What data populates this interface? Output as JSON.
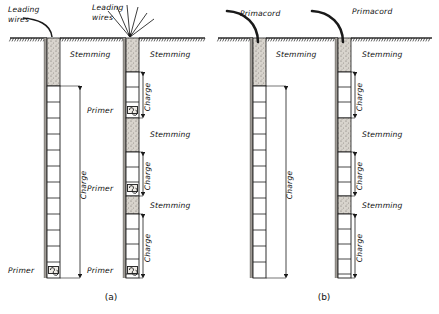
{
  "figure": {
    "type": "engineering-diagram",
    "panels": [
      {
        "id": "a",
        "caption": "(a)",
        "initiation": "Leading wires",
        "caption_x": 111,
        "caption_y": 300
      },
      {
        "id": "b",
        "caption": "(b)",
        "initiation": "Primacord",
        "caption_x": 324,
        "caption_y": 300
      }
    ]
  },
  "labels": {
    "leading_wires_line1": "Leading",
    "leading_wires_line2": "wires",
    "primacord": "Primacord",
    "stemming": "Stemming",
    "charge": "Charge",
    "primer": "Primer"
  },
  "colors": {
    "ink": "#1a1a1a",
    "ground": "#2b2b2b",
    "stemming_fill": "#cfcbc4",
    "rock_fill": "#8f8d89",
    "charge_fill": "#ffffff",
    "paper": "#ffffff"
  },
  "geometry": {
    "ground_y": 38,
    "hole_bottom_default": 278,
    "hole_width": 13
  },
  "holes": [
    {
      "name": "hole-a1",
      "panel": "a",
      "initiation": "leading-wires",
      "x": 47,
      "top": 38,
      "bottom": 278,
      "wire_label_x": 8,
      "wire_label_y": 12,
      "decks": [
        {
          "kind": "stemming",
          "from": 38,
          "to": 86,
          "label": "Stemming",
          "label_x": 70,
          "label_y": 57,
          "dim": false
        },
        {
          "kind": "charge",
          "from": 86,
          "to": 278,
          "label": "Charge",
          "label_x": 86,
          "label_y": 185,
          "dim": true,
          "dim_x": 80
        }
      ],
      "primers": [
        {
          "y": 270,
          "label": "Primer",
          "label_x": 8,
          "label_y": 273
        }
      ],
      "cartridge_step": 16
    },
    {
      "name": "hole-a2",
      "panel": "a",
      "initiation": "leading-wires-multi",
      "x": 126,
      "top": 38,
      "bottom": 278,
      "wire_label_x": 92,
      "wire_label_y": 10,
      "decks": [
        {
          "kind": "stemming",
          "from": 38,
          "to": 72,
          "label": "Stemming",
          "label_x": 150,
          "label_y": 57,
          "dim": false
        },
        {
          "kind": "charge",
          "from": 72,
          "to": 118,
          "label": "Charge",
          "label_x": 150,
          "label_y": 97,
          "dim": true,
          "dim_x": 143
        },
        {
          "kind": "stemming",
          "from": 118,
          "to": 152,
          "label": "Stemming",
          "label_x": 150,
          "label_y": 137,
          "dim": false
        },
        {
          "kind": "charge",
          "from": 152,
          "to": 196,
          "label": "Charge",
          "label_x": 150,
          "label_y": 176,
          "dim": true,
          "dim_x": 143
        },
        {
          "kind": "stemming",
          "from": 196,
          "to": 214,
          "label": "Stemming",
          "label_x": 150,
          "label_y": 208,
          "dim": false
        },
        {
          "kind": "charge",
          "from": 214,
          "to": 278,
          "label": "Charge",
          "label_x": 150,
          "label_y": 248,
          "dim": true,
          "dim_x": 143
        }
      ],
      "primers": [
        {
          "y": 110,
          "label": "Primer",
          "label_x": 87,
          "label_y": 113
        },
        {
          "y": 188,
          "label": "Primer",
          "label_x": 87,
          "label_y": 191
        },
        {
          "y": 270,
          "label": "Primer",
          "label_x": 87,
          "label_y": 273
        }
      ],
      "cartridge_step": 15
    },
    {
      "name": "hole-b1",
      "panel": "b",
      "initiation": "primacord",
      "x": 253,
      "top": 38,
      "bottom": 278,
      "cord_label_x": 240,
      "cord_label_y": 16,
      "decks": [
        {
          "kind": "stemming",
          "from": 38,
          "to": 86,
          "label": "Stemming",
          "label_x": 276,
          "label_y": 57,
          "dim": false
        },
        {
          "kind": "charge",
          "from": 86,
          "to": 278,
          "label": "Charge",
          "label_x": 292,
          "label_y": 185,
          "dim": true,
          "dim_x": 286
        }
      ],
      "primers": [],
      "cartridge_step": 16
    },
    {
      "name": "hole-b2",
      "panel": "b",
      "initiation": "primacord",
      "x": 338,
      "top": 38,
      "bottom": 278,
      "cord_label_x": 352,
      "cord_label_y": 14,
      "decks": [
        {
          "kind": "stemming",
          "from": 38,
          "to": 72,
          "label": "Stemming",
          "label_x": 362,
          "label_y": 57,
          "dim": false
        },
        {
          "kind": "charge",
          "from": 72,
          "to": 118,
          "label": "Charge",
          "label_x": 362,
          "label_y": 97,
          "dim": true,
          "dim_x": 355
        },
        {
          "kind": "stemming",
          "from": 118,
          "to": 152,
          "label": "Stemming",
          "label_x": 362,
          "label_y": 137,
          "dim": false
        },
        {
          "kind": "charge",
          "from": 152,
          "to": 196,
          "label": "Charge",
          "label_x": 362,
          "label_y": 176,
          "dim": true,
          "dim_x": 355
        },
        {
          "kind": "stemming",
          "from": 196,
          "to": 214,
          "label": "Stemming",
          "label_x": 362,
          "label_y": 208,
          "dim": false
        },
        {
          "kind": "charge",
          "from": 214,
          "to": 278,
          "label": "Charge",
          "label_x": 362,
          "label_y": 248,
          "dim": true,
          "dim_x": 355
        }
      ],
      "primers": [],
      "cartridge_step": 15
    }
  ]
}
